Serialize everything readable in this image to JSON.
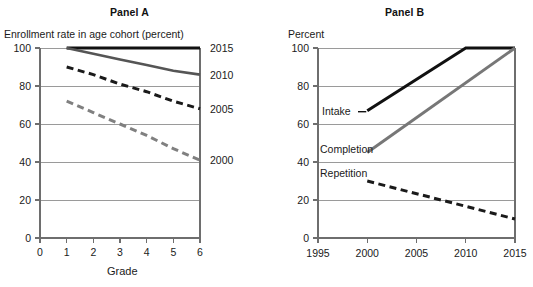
{
  "figure": {
    "clipped_header_text": "",
    "panel_a": {
      "title": "Panel A"
    },
    "panel_b": {
      "title": "Panel B"
    }
  },
  "chart_data": [
    {
      "type": "line",
      "panel": "Panel A",
      "title": "Panel A",
      "ylabel": "Enrollment rate in age cohort (percent)",
      "xlabel": "Grade",
      "x": [
        1,
        2,
        3,
        4,
        5,
        6
      ],
      "xtick_labels": [
        "0",
        "1",
        "2",
        "3",
        "4",
        "5",
        "6"
      ],
      "xticks": [
        0,
        1,
        2,
        3,
        4,
        5,
        6
      ],
      "xlim": [
        0,
        6
      ],
      "ylim": [
        0,
        100
      ],
      "yticks": [
        0,
        20,
        40,
        60,
        80,
        100
      ],
      "ytick_labels": [
        "0",
        "20",
        "40",
        "60",
        "80",
        "100"
      ],
      "grid": true,
      "legend_position": "right-of-line-ends",
      "series": [
        {
          "name": "2015",
          "label": "2015",
          "values": [
            100,
            100,
            100,
            100,
            100,
            100
          ],
          "color": "#111111",
          "style": "solid",
          "width": 3.2
        },
        {
          "name": "2010",
          "label": "2010",
          "values": [
            100,
            97,
            94,
            91,
            88,
            86
          ],
          "color": "#555555",
          "style": "solid",
          "width": 2.6
        },
        {
          "name": "2005",
          "label": "2005",
          "values": [
            90,
            86,
            81,
            77,
            72,
            68
          ],
          "color": "#1a1a1a",
          "style": "dashed",
          "width": 3.0
        },
        {
          "name": "2000",
          "label": "2000",
          "values": [
            72,
            66,
            60,
            54,
            47,
            41
          ],
          "color": "#808080",
          "style": "dashed",
          "width": 3.0
        }
      ]
    },
    {
      "type": "line",
      "panel": "Panel B",
      "title": "Panel B",
      "ylabel": "Percent",
      "xlabel": "",
      "x": [
        1995,
        2000,
        2005,
        2010,
        2015
      ],
      "xtick_labels": [
        "1995",
        "2000",
        "2005",
        "2010",
        "2015"
      ],
      "xticks": [
        1995,
        2000,
        2005,
        2010,
        2015
      ],
      "xlim": [
        1995,
        2015
      ],
      "ylim": [
        0,
        100
      ],
      "yticks": [
        0,
        20,
        40,
        60,
        80,
        100
      ],
      "ytick_labels": [
        "0",
        "20",
        "40",
        "60",
        "80",
        "100"
      ],
      "grid": true,
      "legend_position": "inline-labels",
      "series": [
        {
          "name": "Intake",
          "label": "Intake",
          "x": [
            2000,
            2010,
            2015
          ],
          "values": [
            67,
            100,
            100
          ],
          "color": "#111111",
          "style": "solid",
          "width": 3.0
        },
        {
          "name": "Completion",
          "label": "Completion",
          "x": [
            2000,
            2015
          ],
          "values": [
            45,
            100
          ],
          "color": "#777777",
          "style": "solid",
          "width": 3.0
        },
        {
          "name": "Repetition",
          "label": "Repetition",
          "x": [
            2000,
            2015
          ],
          "values": [
            30,
            10
          ],
          "color": "#1a1a1a",
          "style": "dashed",
          "width": 3.0
        }
      ]
    }
  ]
}
